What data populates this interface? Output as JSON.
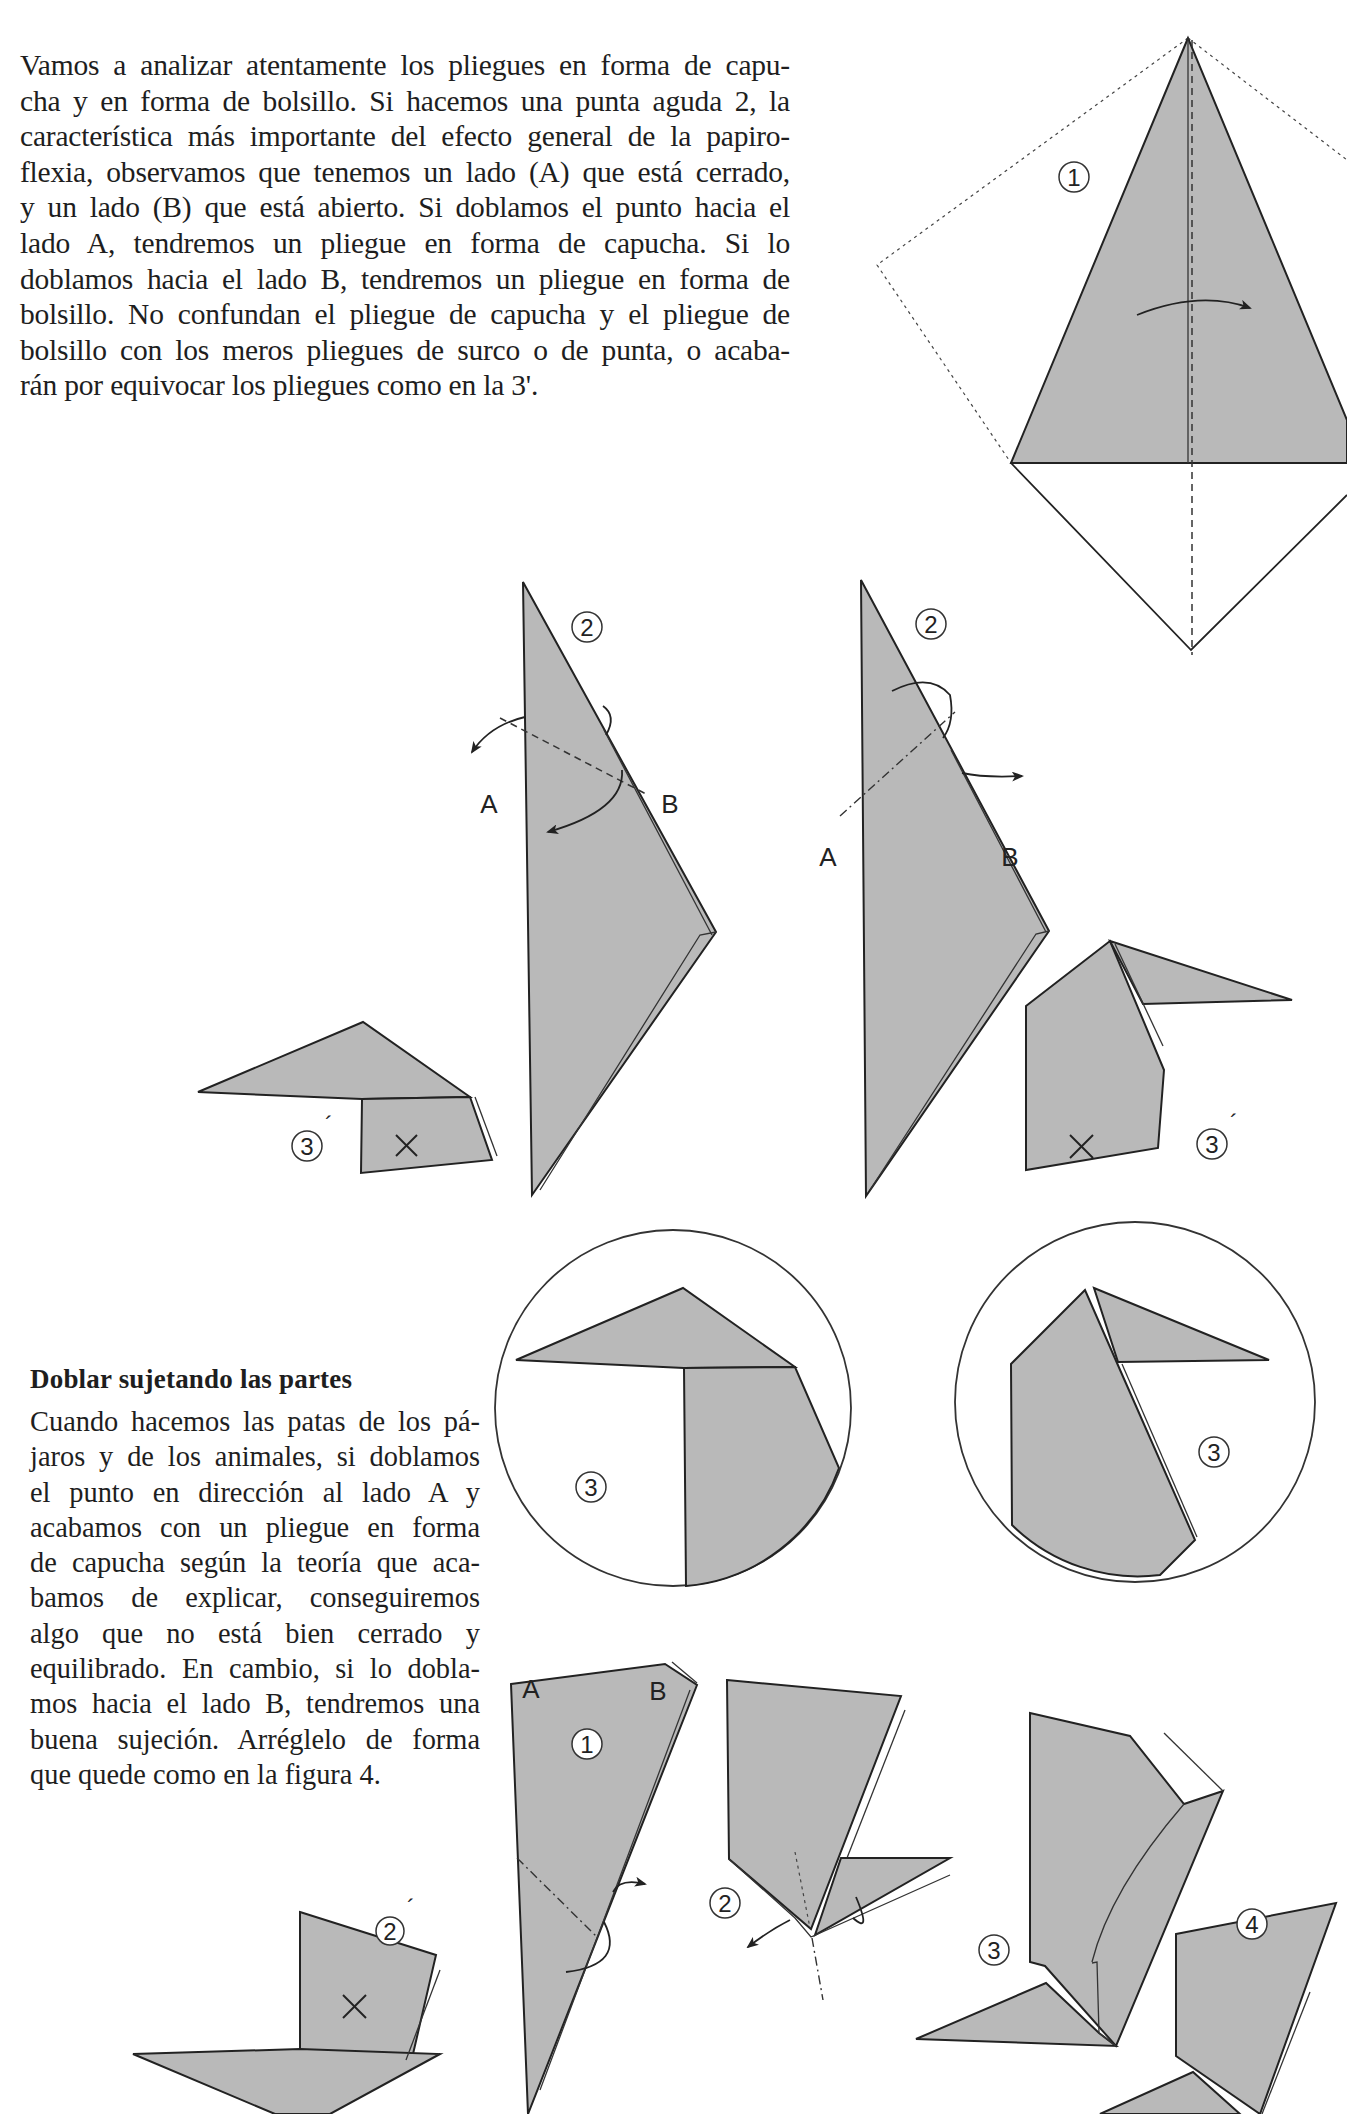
{
  "intro": {
    "lines": [
      "Vamos a analizar atentamente los pliegues en forma de capu-",
      "cha y en forma de bolsillo. Si hacemos una punta aguda 2, la",
      "característica más importante del efecto general de la papiro-",
      "flexia, observamos que tenemos un lado (A) que está cerrado,",
      "y un lado (B) que está abierto. Si doblamos el punto hacia el",
      "lado A, tendremos un pliegue en forma de capucha. Si lo",
      "doblamos hacia el lado B, tendremos un pliegue en forma de",
      "bolsillo. No confundan el pliegue de capucha y el pliegue de",
      "bolsillo con los meros pliegues de surco o de punta, o acaba-",
      "rán por equivocar los pliegues como en la 3'."
    ]
  },
  "section": {
    "title": "Doblar sujetando las partes",
    "lines": [
      "Cuando hacemos las patas de los pá-",
      "jaros y de los animales, si doblamos",
      "el punto en dirección al lado A y",
      "acabamos con un pliegue en forma",
      "de capucha según la teoría que aca-",
      "bamos de explicar, conseguiremos",
      "algo que no está bien cerrado y",
      "equilibrado. En cambio, si lo dobla-",
      "mos hacia el lado B, tendremos una",
      "buena sujeción. Arréglelo de forma",
      "que quede como en la figura 4."
    ]
  },
  "figures": {
    "top_kite": {
      "step": "1"
    },
    "hood_fold": {
      "step": "2",
      "side_a": "A",
      "side_b": "B",
      "wrong_step": "3",
      "wrong_mark": "´",
      "x_mark": "×"
    },
    "pocket_fold": {
      "step": "2",
      "side_a": "A",
      "side_b": "B",
      "wrong_step": "3",
      "wrong_mark": "´",
      "x_mark": "×"
    },
    "detail_left": {
      "step": "3"
    },
    "detail_right": {
      "step": "3"
    },
    "leg_sequence": {
      "step1": "1",
      "side_a": "A",
      "side_b": "B",
      "step2": "2",
      "step2_wrong": "2",
      "wrong_mark": "´",
      "x_mark": "×",
      "step3": "3",
      "step4": "4"
    }
  },
  "colors": {
    "paper_gray": "#b9b9b9",
    "ink": "#222222",
    "background": "#ffffff"
  }
}
